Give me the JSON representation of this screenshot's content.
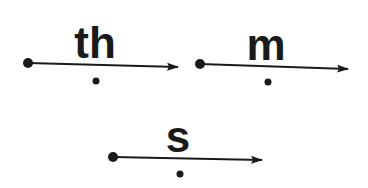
{
  "diagram": {
    "ink_color": "#1a1a1a",
    "items": [
      {
        "label": "th",
        "start": [
          28,
          63
        ],
        "end": [
          178,
          67
        ],
        "label_x": 95,
        "label_y": 58,
        "dot": [
          96,
          81
        ]
      },
      {
        "label": "m",
        "start": [
          200,
          64
        ],
        "end": [
          348,
          69
        ],
        "label_x": 266,
        "label_y": 60,
        "dot": [
          268,
          82
        ]
      },
      {
        "label": "s",
        "start": [
          113,
          157
        ],
        "end": [
          262,
          160
        ],
        "label_x": 178,
        "label_y": 152,
        "dot": [
          180,
          174
        ]
      }
    ]
  }
}
